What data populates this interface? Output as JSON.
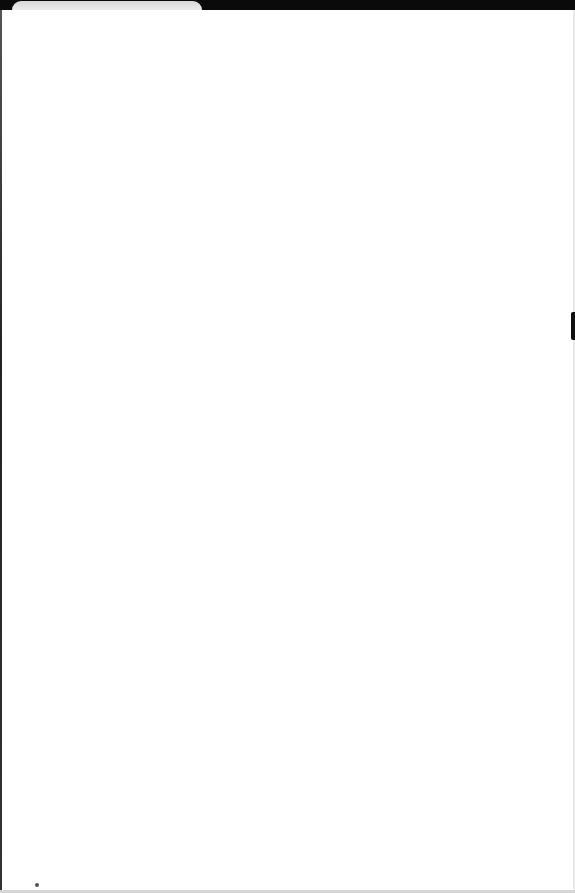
{
  "window": {
    "tab": {
      "label": ""
    },
    "colors": {
      "topbar": "#0a0a0a",
      "page_background": "#ffffff"
    }
  },
  "page": {
    "content": ""
  }
}
